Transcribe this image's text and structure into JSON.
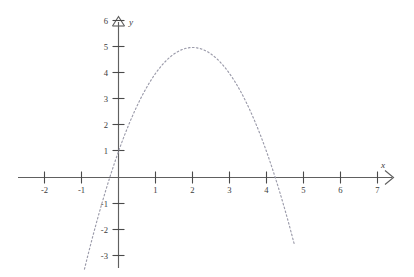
{
  "chart_data": {
    "type": "line",
    "title": "",
    "subtitle": "",
    "xlabel": "x",
    "ylabel": "y",
    "xlim": [
      -2.6,
      7.6
    ],
    "ylim": [
      -3.3,
      6.3
    ],
    "grid": false,
    "legend": null,
    "annotations": [],
    "xticks": [
      -2,
      -1,
      1,
      2,
      3,
      4,
      5,
      6,
      7
    ],
    "xticklabels": [
      "-2",
      "-1",
      "1",
      "2",
      "3",
      "4",
      "5",
      "6",
      "7"
    ],
    "yticks": [
      -3,
      -2,
      -1,
      1,
      2,
      3,
      4,
      5,
      6
    ],
    "yticklabels": [
      "-3",
      "-2",
      "-1",
      "1",
      "2",
      "3",
      "4",
      "5",
      "6"
    ],
    "series": [
      {
        "name": "parabola",
        "style": "dotted",
        "color": "#9b9baa",
        "equation": "y = -x^2 + 4x + 1",
        "vertex": [
          2,
          5
        ],
        "y_intercept": 1,
        "x_intercepts": [
          -0.24,
          4.24
        ],
        "x": [
          -0.9,
          -0.8,
          -0.6,
          -0.4,
          -0.24,
          0,
          0.5,
          1,
          1.5,
          2,
          2.5,
          3,
          3.5,
          4,
          4.24,
          4.5,
          4.8,
          5
        ],
        "y": [
          -3.41,
          -2.84,
          -1.76,
          -0.76,
          0,
          1,
          2.75,
          4,
          4.75,
          5,
          4.75,
          4,
          2.75,
          1,
          0,
          -1.25,
          -3.24,
          -4
        ]
      }
    ]
  },
  "axes": {
    "x_axis_label": "x",
    "y_axis_label": "y",
    "x_arrow": "arrow-right",
    "y_arrow": "arrow-up"
  }
}
